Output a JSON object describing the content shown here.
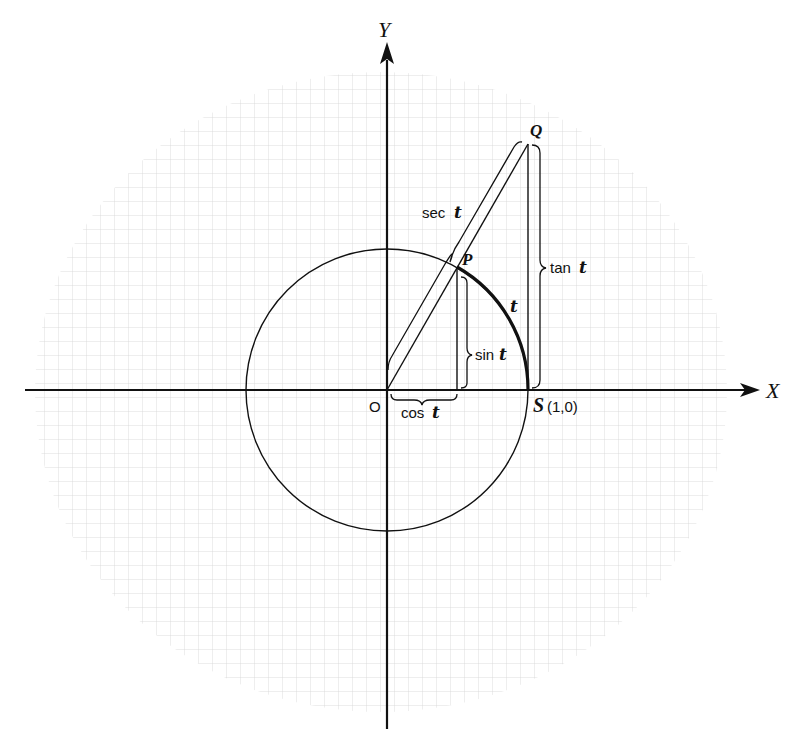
{
  "figure": {
    "axes": {
      "x_label": "X",
      "y_label": "Y",
      "origin_label": "O"
    },
    "points": {
      "P": "P",
      "Q": "Q",
      "S_letter": "S",
      "S_coords": "(1,0)"
    },
    "segments": {
      "sec": {
        "func": "sec",
        "var": "t"
      },
      "tan": {
        "func": "tan",
        "var": "t"
      },
      "sin": {
        "func": "sin",
        "var": "t"
      },
      "cos": {
        "func": "cos",
        "var": "t"
      },
      "arc": {
        "var": "t"
      }
    },
    "geometry": {
      "origin": [
        387,
        390
      ],
      "radius_px": 141,
      "angle_deg": 60.4,
      "grid_spacing_px": 14
    },
    "colors": {
      "ink": "#111111",
      "grid": "#cfcfcf"
    }
  }
}
